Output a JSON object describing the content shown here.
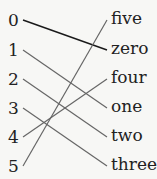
{
  "left": [
    "0",
    "1",
    "2",
    "3",
    "4",
    "5"
  ],
  "right": [
    "five",
    "zero",
    "four",
    "one",
    "two",
    "three"
  ],
  "row_y": [
    20,
    50,
    79,
    108,
    137,
    166
  ],
  "connections": [
    {
      "from": "0",
      "to": "zero",
      "color": "#1a1a1a"
    },
    {
      "from": "1",
      "to": "one",
      "color": "#666666"
    },
    {
      "from": "2",
      "to": "two",
      "color": "#666666"
    },
    {
      "from": "3",
      "to": "three",
      "color": "#666666"
    },
    {
      "from": "4",
      "to": "four",
      "color": "#666666"
    },
    {
      "from": "5",
      "to": "five",
      "color": "#666666"
    }
  ]
}
